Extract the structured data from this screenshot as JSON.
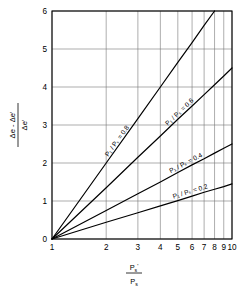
{
  "chart_data": {
    "type": "line",
    "title": "",
    "subtitle": "",
    "xlabel": "P's / Ps",
    "ylabel": "(Δe - Δe') / Δe'",
    "xscale": "log",
    "yscale": "linear",
    "xlim": [
      1,
      10
    ],
    "ylim": [
      0,
      6
    ],
    "grid": true,
    "legend_position": "inline-on-curves",
    "x_ticks": [
      1,
      2,
      3,
      4,
      5,
      6,
      7,
      8,
      9,
      10
    ],
    "x_tick_labels": [
      "1",
      "2",
      "3",
      "4",
      "5",
      "6",
      "7",
      "8",
      "9",
      "10"
    ],
    "y_ticks": [
      0,
      1,
      2,
      3,
      4,
      5,
      6
    ],
    "y_tick_labels": [
      "0",
      "1",
      "2",
      "3",
      "4",
      "5",
      "6"
    ],
    "x": [
      1,
      2,
      3,
      4,
      5,
      6,
      7,
      8,
      9,
      10
    ],
    "series": [
      {
        "name": "P1 / Ps = 0.8",
        "label": "P₁ / Pₛ = 0.8",
        "slope_per_decade": 6.65,
        "values": [
          0,
          2.0,
          3.17,
          4.0,
          4.65,
          5.17,
          5.62,
          6.0,
          6.35,
          6.65
        ]
      },
      {
        "name": "P1 / Ps = 0.6",
        "label": "P₁ / Pₛ = 0.6",
        "slope_per_decade": 4.5,
        "values": [
          0,
          1.35,
          2.15,
          2.71,
          3.15,
          3.5,
          3.8,
          4.06,
          4.29,
          4.5
        ]
      },
      {
        "name": "P1 / Ps = 0.4",
        "label": "P₁ / Pₛ = 0.4",
        "slope_per_decade": 2.5,
        "values": [
          0,
          0.75,
          1.19,
          1.5,
          1.75,
          1.95,
          2.11,
          2.26,
          2.39,
          2.5
        ]
      },
      {
        "name": "P1 / Ps = 0.2",
        "label": "P₁ / Pₛ = 0.2",
        "slope_per_decade": 1.45,
        "values": [
          0,
          0.44,
          0.69,
          0.87,
          1.01,
          1.13,
          1.23,
          1.31,
          1.38,
          1.45
        ]
      }
    ]
  },
  "axis_titles": {
    "x_numerator": "P",
    "x_numerator_sub": "s",
    "x_numerator_prime": "'",
    "x_denominator": "P",
    "x_denominator_sub": "s",
    "y_numerator": "Δe - Δe'",
    "y_denominator": "Δe'"
  },
  "colors": {
    "curve": "#000000",
    "grid": "#777777",
    "axis": "#000000",
    "background": "#ffffff"
  }
}
